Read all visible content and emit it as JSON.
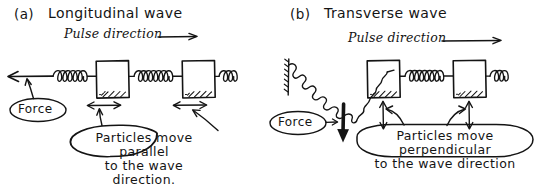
{
  "figure": {
    "kind": "hand-drawn-physics-diagram",
    "background_color": "#ffffff",
    "ink_color": "#141414"
  },
  "panels": [
    {
      "id": "panel-a",
      "label": "(a)",
      "title": "Longitudinal wave",
      "pulse_label": "Pulse direction",
      "pulse_arrow": "right-arrow-icon",
      "force_label": "Force",
      "force_arrow_direction": "left",
      "particle_motion_arrow": "horizontal-double-arrow-icon",
      "callout_line1": "Particles move parallel",
      "callout_line2": "to the wave direction.",
      "blocks": 2,
      "springs": 3
    },
    {
      "id": "panel-b",
      "label": "(b)",
      "title": "Transverse wave",
      "pulse_label": "Pulse direction",
      "pulse_arrow": "right-arrow-icon",
      "force_label": "Force",
      "force_arrow_direction": "down",
      "particle_motion_arrow": "vertical-double-arrow-icon",
      "callout_line1": "Particles move perpendicular",
      "callout_line2": "to the wave direction",
      "blocks": 2,
      "springs": 3
    }
  ]
}
